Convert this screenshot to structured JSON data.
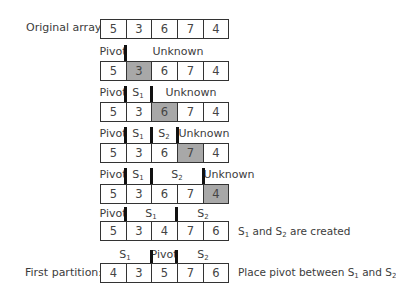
{
  "labels": {
    "original": "Original array:",
    "first_partition": "First partition:"
  },
  "colors": {
    "shaded": "#a8a8a8",
    "border": "#333333",
    "bar": "#111111"
  },
  "rows": [
    {
      "values": [
        "5",
        "3",
        "6",
        "7",
        "4"
      ],
      "shaded": []
    },
    {
      "values": [
        "5",
        "3",
        "6",
        "7",
        "4"
      ],
      "shaded": [
        1
      ],
      "segments": [
        {
          "text": "Pivot"
        },
        {
          "text": "Unknown"
        }
      ]
    },
    {
      "values": [
        "5",
        "3",
        "6",
        "7",
        "4"
      ],
      "shaded": [
        2
      ],
      "segments": [
        {
          "text": "Pivot"
        },
        {
          "text": "S",
          "sub": "1"
        },
        {
          "text": "Unknown"
        }
      ]
    },
    {
      "values": [
        "5",
        "3",
        "6",
        "7",
        "4"
      ],
      "shaded": [
        3
      ],
      "segments": [
        {
          "text": "Pivot"
        },
        {
          "text": "S",
          "sub": "1"
        },
        {
          "text": "S",
          "sub": "2"
        },
        {
          "text": "Unknown"
        }
      ]
    },
    {
      "values": [
        "5",
        "3",
        "6",
        "7",
        "4"
      ],
      "shaded": [
        4
      ],
      "segments": [
        {
          "text": "Pivot"
        },
        {
          "text": "S",
          "sub": "1"
        },
        {
          "text": "S",
          "sub": "2"
        },
        {
          "text": "Unknown"
        }
      ]
    },
    {
      "values": [
        "5",
        "3",
        "4",
        "7",
        "6"
      ],
      "shaded": [],
      "segments": [
        {
          "text": "Pivot"
        },
        {
          "text": "S",
          "sub": "1"
        },
        {
          "text": "S",
          "sub": "2"
        }
      ],
      "caption": {
        "parts": [
          "S",
          "1",
          " and S",
          "2",
          " are created"
        ]
      }
    },
    {
      "values": [
        "4",
        "3",
        "5",
        "7",
        "6"
      ],
      "shaded": [],
      "segments": [
        {
          "text": "S",
          "sub": "1"
        },
        {
          "text": "Pivot"
        },
        {
          "text": "S",
          "sub": "2"
        }
      ],
      "caption": {
        "parts": [
          "Place pivot between S",
          "1",
          " and S",
          "2",
          ""
        ]
      }
    }
  ]
}
